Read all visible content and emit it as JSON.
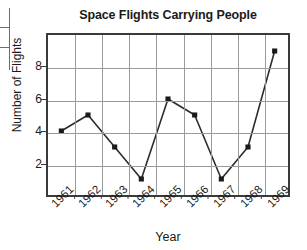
{
  "left_fragment": {
    "name": "cropped-table-edge",
    "rows": [
      "",
      "",
      ""
    ]
  },
  "chart_data": {
    "type": "line",
    "title": "Space Flights Carrying People",
    "xlabel": "Year",
    "ylabel": "Number of Flights",
    "categories": [
      "1961",
      "1962",
      "1963",
      "1964",
      "1965",
      "1966",
      "1967",
      "1968",
      "1969"
    ],
    "values": [
      4,
      5,
      3,
      1,
      6,
      5,
      1,
      3,
      9
    ],
    "ylim": [
      0,
      10
    ],
    "y_ticks": [
      2,
      4,
      6,
      8
    ],
    "y_tick_labels": [
      "2",
      "4",
      "6",
      "8"
    ],
    "grid": true,
    "legend": null,
    "marker": "filled-square",
    "line_color": "#2b2b2b",
    "marker_color": "#1a1a1a",
    "grid_color": "#9a9a9a",
    "axis_color": "#3a3a3a",
    "background_color": "#ffffff",
    "x_tick_rotation": -45
  }
}
